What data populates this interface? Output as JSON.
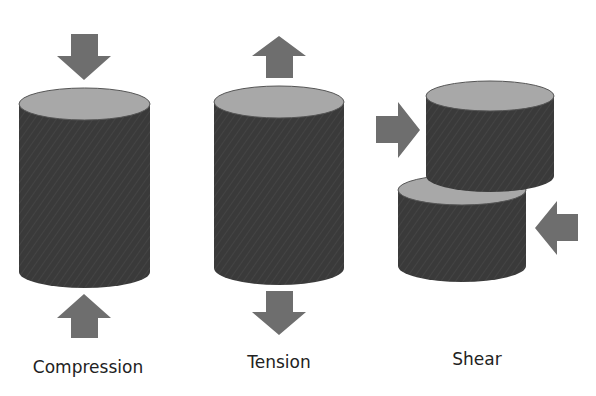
{
  "colors": {
    "body": "#3a3a3a",
    "top": "#a8a8a8",
    "arrow": "#6e6e6e",
    "text": "#222222"
  },
  "diagram": {
    "panels": [
      {
        "label": "Compression",
        "arrows": [
          "down-into-top",
          "up-into-bottom"
        ]
      },
      {
        "label": "Tension",
        "arrows": [
          "up-away-from-top",
          "down-away-from-bottom"
        ]
      },
      {
        "label": "Shear",
        "arrows": [
          "right-into-upper-left",
          "left-into-lower-right"
        ]
      }
    ]
  }
}
